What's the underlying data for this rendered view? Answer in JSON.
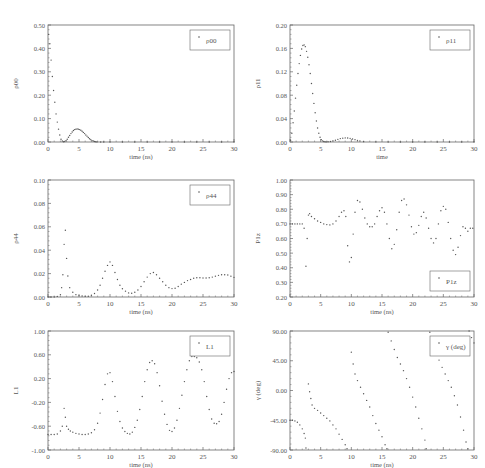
{
  "figure": {
    "width": 485,
    "height": 468,
    "colors": {
      "axis": "#666666",
      "marker": "#555555",
      "text": "#555555",
      "background": "#ffffff"
    }
  },
  "chart_data": [
    {
      "id": "rho00",
      "type": "scatter",
      "title": "",
      "xlabel": "time (ns)",
      "ylabel": "ρ00",
      "legend": "ρ00",
      "legend_position": "top-right",
      "xlim": [
        0,
        30
      ],
      "ylim": [
        0,
        0.5
      ],
      "xticks": [
        0,
        5,
        10,
        15,
        20,
        25,
        30
      ],
      "xtick_labels": [
        "0",
        "5",
        "10",
        "15",
        "20",
        "25",
        "30"
      ],
      "yticks": [
        0,
        0.1,
        0.2,
        0.3,
        0.4,
        0.5
      ],
      "ytick_labels": [
        "0.00",
        "0.10",
        "0.20",
        "0.30",
        "0.40",
        "0.50"
      ],
      "x": [
        0.1,
        0.3,
        0.5,
        0.7,
        0.9,
        1.1,
        1.3,
        1.5,
        1.7,
        1.9,
        2.1,
        2.3,
        2.5,
        2.7,
        2.9,
        3.1,
        3.3,
        3.5,
        3.7,
        3.9,
        4.1,
        4.3,
        4.5,
        4.7,
        4.9,
        5.1,
        5.3,
        5.5,
        5.7,
        5.9,
        6.1,
        6.3,
        6.5,
        6.7,
        6.9,
        7.1,
        7.3,
        7.5,
        7.7,
        7.9,
        8.5,
        9,
        10,
        12,
        14,
        16,
        18,
        20,
        22,
        24,
        26,
        28,
        30
      ],
      "y": [
        0.46,
        0.42,
        0.35,
        0.28,
        0.22,
        0.17,
        0.12,
        0.085,
        0.055,
        0.03,
        0.012,
        0.004,
        0.001,
        0.002,
        0.006,
        0.012,
        0.02,
        0.028,
        0.036,
        0.043,
        0.049,
        0.053,
        0.055,
        0.056,
        0.055,
        0.053,
        0.05,
        0.046,
        0.041,
        0.036,
        0.03,
        0.025,
        0.019,
        0.014,
        0.01,
        0.006,
        0.004,
        0.002,
        0.001,
        0.0005,
        0.0003,
        0.0002,
        0.0001,
        0.0001,
        0.0001,
        0.0001,
        0.0001,
        0.0001,
        0.0001,
        0.0001,
        0.0001,
        0.0001,
        0.0001
      ]
    },
    {
      "id": "rho11",
      "type": "scatter",
      "title": "",
      "xlabel": "time",
      "ylabel": "ρ11",
      "legend": "ρ11",
      "legend_position": "top-right",
      "xlim": [
        0,
        30
      ],
      "ylim": [
        0,
        0.2
      ],
      "xticks": [
        0,
        5,
        10,
        15,
        20,
        25,
        30
      ],
      "xtick_labels": [
        "0",
        "5",
        "10",
        "15",
        "20",
        "25",
        "30"
      ],
      "yticks": [
        0,
        0.04,
        0.08,
        0.12,
        0.16,
        0.2
      ],
      "ytick_labels": [
        "0.00",
        "0.04",
        "0.08",
        "0.12",
        "0.16",
        "0.20"
      ],
      "x": [
        0.1,
        0.3,
        0.5,
        0.7,
        0.9,
        1.1,
        1.3,
        1.5,
        1.7,
        1.9,
        2.1,
        2.3,
        2.5,
        2.7,
        2.9,
        3.1,
        3.3,
        3.5,
        3.7,
        3.9,
        4.1,
        4.3,
        4.5,
        4.7,
        4.9,
        5.1,
        5.3,
        5.5,
        5.7,
        5.9,
        6.2,
        6.6,
        7,
        7.4,
        7.8,
        8.2,
        8.6,
        9,
        9.4,
        9.8,
        10.2,
        10.6,
        11,
        11.4,
        12,
        14,
        16,
        18,
        20,
        22,
        24,
        26,
        28,
        30
      ],
      "y": [
        0.003,
        0.015,
        0.033,
        0.053,
        0.075,
        0.097,
        0.117,
        0.134,
        0.148,
        0.159,
        0.165,
        0.166,
        0.163,
        0.155,
        0.145,
        0.132,
        0.117,
        0.1,
        0.083,
        0.066,
        0.05,
        0.036,
        0.024,
        0.015,
        0.008,
        0.004,
        0.002,
        0.0008,
        0.0003,
        0.0002,
        0.0003,
        0.0008,
        0.002,
        0.003,
        0.0045,
        0.0058,
        0.0066,
        0.007,
        0.0068,
        0.0062,
        0.0052,
        0.004,
        0.0028,
        0.0016,
        0.0006,
        0.0002,
        0.0001,
        0.0001,
        0.0001,
        0.0001,
        0.0001,
        0.0001,
        0.0001,
        0.0001
      ]
    },
    {
      "id": "rho44",
      "type": "scatter",
      "title": "",
      "xlabel": "time (ns)",
      "ylabel": "ρ44",
      "legend": "ρ44",
      "legend_position": "top-right",
      "xlim": [
        0,
        30
      ],
      "ylim": [
        0,
        0.1
      ],
      "xticks": [
        0,
        5,
        10,
        15,
        20,
        25,
        30
      ],
      "xtick_labels": [
        "0",
        "5",
        "10",
        "15",
        "20",
        "25",
        "30"
      ],
      "yticks": [
        0,
        0.02,
        0.04,
        0.06,
        0.08,
        0.1
      ],
      "ytick_labels": [
        "0.00",
        "0.02",
        "0.04",
        "0.06",
        "0.08",
        "0.10"
      ],
      "x": [
        0,
        0.5,
        1,
        1.5,
        2,
        2.2,
        2.4,
        2.6,
        2.8,
        3,
        3.2,
        3.5,
        4,
        4.5,
        5,
        5.5,
        6,
        6.5,
        7,
        7.5,
        8,
        8.4,
        8.8,
        9.2,
        9.6,
        10,
        10.4,
        10.8,
        11.2,
        11.6,
        12,
        12.5,
        13,
        13.5,
        14,
        14.5,
        15,
        15.5,
        16,
        16.5,
        17,
        17.5,
        18,
        18.5,
        19,
        19.5,
        20,
        20.5,
        21,
        21.5,
        22,
        22.5,
        23,
        23.5,
        24,
        24.5,
        25,
        25.5,
        26,
        26.5,
        27,
        27.5,
        28,
        28.5,
        29,
        29.5,
        30
      ],
      "y": [
        0,
        0,
        0,
        0.0005,
        0.002,
        0.008,
        0.019,
        0.045,
        0.057,
        0.033,
        0.018,
        0.008,
        0.004,
        0.002,
        0.0012,
        0.0008,
        0.0006,
        0.0007,
        0.0015,
        0.003,
        0.006,
        0.01,
        0.016,
        0.022,
        0.027,
        0.03,
        0.027,
        0.021,
        0.015,
        0.01,
        0.007,
        0.005,
        0.0035,
        0.0032,
        0.004,
        0.006,
        0.009,
        0.013,
        0.017,
        0.02,
        0.021,
        0.019,
        0.016,
        0.013,
        0.01,
        0.008,
        0.0072,
        0.0075,
        0.009,
        0.011,
        0.0125,
        0.014,
        0.015,
        0.016,
        0.0165,
        0.0165,
        0.0162,
        0.0162,
        0.0165,
        0.017,
        0.0178,
        0.0185,
        0.019,
        0.019,
        0.0188,
        0.0178,
        0.0168
      ]
    },
    {
      "id": "P1z",
      "type": "scatter",
      "title": "",
      "xlabel": "time (ns)",
      "ylabel": "P1z",
      "legend": "P1z",
      "legend_position": "bottom-right",
      "xlim": [
        0,
        30
      ],
      "ylim": [
        0.2,
        1.0
      ],
      "xticks": [
        0,
        5,
        10,
        15,
        20,
        25,
        30
      ],
      "xtick_labels": [
        "0",
        "5",
        "10",
        "15",
        "20",
        "25",
        "30"
      ],
      "yticks": [
        0.2,
        0.3,
        0.4,
        0.5,
        0.6,
        0.7,
        0.8,
        0.9,
        1.0
      ],
      "ytick_labels": [
        "0.20",
        "0.30",
        "0.40",
        "0.50",
        "0.60",
        "0.70",
        "0.80",
        "0.90",
        "1.00"
      ],
      "x": [
        0,
        0.4,
        0.8,
        1.2,
        1.6,
        2,
        2.3,
        2.6,
        2.8,
        3,
        3.2,
        3.5,
        4,
        4.5,
        5,
        5.5,
        6,
        6.5,
        7,
        7.5,
        8,
        8.4,
        8.8,
        9.1,
        9.4,
        9.7,
        10,
        10.3,
        10.6,
        11,
        11.4,
        11.8,
        12.2,
        12.6,
        13,
        13.4,
        13.8,
        14.2,
        14.6,
        15,
        15.4,
        15.8,
        16.2,
        16.6,
        17,
        17.4,
        17.8,
        18.2,
        18.6,
        19,
        19.4,
        19.8,
        20.2,
        20.6,
        21,
        21.4,
        21.8,
        22.2,
        22.6,
        23,
        23.4,
        23.8,
        24.2,
        24.6,
        25,
        25.4,
        25.8,
        26.2,
        26.6,
        27,
        27.4,
        27.8,
        28.2,
        28.6,
        29,
        29.4,
        29.8
      ],
      "y": [
        0.7,
        0.7,
        0.7,
        0.7,
        0.7,
        0.7,
        0.67,
        0.41,
        0.6,
        0.76,
        0.77,
        0.75,
        0.735,
        0.72,
        0.71,
        0.7,
        0.695,
        0.693,
        0.7,
        0.72,
        0.75,
        0.78,
        0.79,
        0.75,
        0.55,
        0.44,
        0.47,
        0.63,
        0.78,
        0.86,
        0.85,
        0.8,
        0.74,
        0.7,
        0.68,
        0.68,
        0.7,
        0.75,
        0.79,
        0.81,
        0.78,
        0.7,
        0.6,
        0.53,
        0.56,
        0.66,
        0.78,
        0.86,
        0.87,
        0.83,
        0.76,
        0.68,
        0.63,
        0.64,
        0.69,
        0.75,
        0.78,
        0.74,
        0.67,
        0.6,
        0.57,
        0.6,
        0.7,
        0.79,
        0.82,
        0.8,
        0.71,
        0.6,
        0.52,
        0.49,
        0.54,
        0.62,
        0.68,
        0.67,
        0.65,
        0.67,
        0.67
      ]
    },
    {
      "id": "L1",
      "type": "scatter",
      "title": "",
      "xlabel": "time (ns)",
      "ylabel": "L1",
      "legend": "L1",
      "legend_position": "top-right",
      "xlim": [
        0,
        30
      ],
      "ylim": [
        -1.0,
        1.0
      ],
      "xticks": [
        0,
        5,
        10,
        15,
        20,
        25,
        30
      ],
      "xtick_labels": [
        "0",
        "5",
        "10",
        "15",
        "20",
        "25",
        "30"
      ],
      "yticks": [
        -1.0,
        -0.6,
        -0.2,
        0.2,
        0.6,
        1.0
      ],
      "ytick_labels": [
        "-1.00",
        "-0.60",
        "-0.20",
        "0.20",
        "0.60",
        "1.00"
      ],
      "x": [
        0,
        0.5,
        1,
        1.5,
        2,
        2.3,
        2.6,
        2.8,
        3,
        3.3,
        3.6,
        4,
        4.5,
        5,
        5.5,
        6,
        6.5,
        7,
        7.5,
        8,
        8.4,
        8.8,
        9.2,
        9.6,
        10,
        10.4,
        10.8,
        11.2,
        11.6,
        12,
        12.4,
        12.8,
        13.2,
        13.6,
        14,
        14.4,
        14.8,
        15.2,
        15.6,
        16,
        16.4,
        16.8,
        17.2,
        17.6,
        18,
        18.4,
        18.8,
        19.2,
        19.6,
        20,
        20.4,
        20.8,
        21.2,
        21.6,
        22,
        22.4,
        22.8,
        23.2,
        23.6,
        24,
        24.4,
        24.8,
        25.2,
        25.6,
        26,
        26.4,
        26.8,
        27.2,
        27.6,
        28,
        28.4,
        28.8,
        29.2,
        29.6,
        30
      ],
      "y": [
        -0.74,
        -0.74,
        -0.74,
        -0.73,
        -0.68,
        -0.6,
        -0.3,
        -0.45,
        -0.6,
        -0.65,
        -0.68,
        -0.7,
        -0.72,
        -0.73,
        -0.74,
        -0.74,
        -0.73,
        -0.71,
        -0.66,
        -0.55,
        -0.38,
        -0.15,
        0.1,
        0.28,
        0.3,
        0.15,
        -0.1,
        -0.35,
        -0.52,
        -0.63,
        -0.69,
        -0.72,
        -0.73,
        -0.7,
        -0.62,
        -0.5,
        -0.32,
        -0.1,
        0.15,
        0.35,
        0.47,
        0.5,
        0.45,
        0.3,
        0.08,
        -0.18,
        -0.4,
        -0.57,
        -0.67,
        -0.69,
        -0.63,
        -0.5,
        -0.3,
        -0.08,
        0.15,
        0.35,
        0.5,
        0.57,
        0.57,
        0.55,
        0.48,
        0.35,
        0.15,
        -0.1,
        -0.32,
        -0.48,
        -0.55,
        -0.56,
        -0.52,
        -0.4,
        -0.2,
        0.02,
        0.2,
        0.3,
        0.32
      ]
    },
    {
      "id": "gamma",
      "type": "scatter",
      "title": "",
      "xlabel": "time (ns)",
      "ylabel": "γ (deg)",
      "legend": "γ (deg)",
      "legend_position": "top-right",
      "xlim": [
        0,
        30
      ],
      "ylim": [
        -90,
        90
      ],
      "xticks": [
        0,
        5,
        10,
        15,
        20,
        25,
        30
      ],
      "xtick_labels": [
        "0",
        "5",
        "10",
        "15",
        "20",
        "25",
        "30"
      ],
      "yticks": [
        -90,
        -45,
        0,
        45,
        90
      ],
      "ytick_labels": [
        "-90.00",
        "-45.00",
        "0.00",
        "45.00",
        "90.00"
      ],
      "segments": [
        {
          "x": [
            0,
            0.4,
            0.8,
            1.2,
            1.6,
            2,
            2.3,
            2.5
          ],
          "y": [
            -45,
            -45,
            -46,
            -48,
            -52,
            -58,
            -65,
            -72
          ]
        },
        {
          "x": [
            2.6
          ],
          "y": [
            -87
          ]
        },
        {
          "x": [
            3,
            3.2,
            3.4,
            3.6,
            4,
            4.5,
            5,
            5.5,
            6,
            6.5,
            7,
            7.5,
            8,
            8.5,
            9,
            9.3
          ],
          "y": [
            10,
            -2,
            -12,
            -22,
            -27,
            -30,
            -34,
            -38,
            -42,
            -46,
            -52,
            -58,
            -66,
            -74,
            -82,
            -88
          ]
        },
        {
          "x": [
            10,
            10.3,
            10.6,
            11,
            11.5,
            12,
            12.5,
            13,
            13.5,
            14,
            14.5,
            15,
            15.5,
            15.8
          ],
          "y": [
            58,
            40,
            25,
            15,
            5,
            -5,
            -15,
            -25,
            -38,
            -50,
            -60,
            -70,
            -82,
            -88
          ]
        },
        {
          "x": [
            16,
            16.5,
            17,
            17.5,
            18,
            18.5,
            19,
            19.5,
            20,
            20.5,
            21,
            21.5,
            22,
            22.2
          ],
          "y": [
            88,
            75,
            62,
            50,
            40,
            30,
            18,
            5,
            -10,
            -25,
            -42,
            -58,
            -75,
            -88
          ]
        },
        {
          "x": [
            22.8,
            23.3,
            23.8,
            24.3,
            24.8,
            25.3,
            25.8,
            26.3,
            26.8,
            27.3,
            27.8,
            28.3,
            28.7,
            29
          ],
          "y": [
            88,
            75,
            60,
            46,
            35,
            25,
            15,
            5,
            -8,
            -22,
            -40,
            -60,
            -78,
            -88
          ]
        },
        {
          "x": [
            29.2,
            29.6,
            30
          ],
          "y": [
            90,
            80,
            72
          ]
        }
      ]
    }
  ]
}
